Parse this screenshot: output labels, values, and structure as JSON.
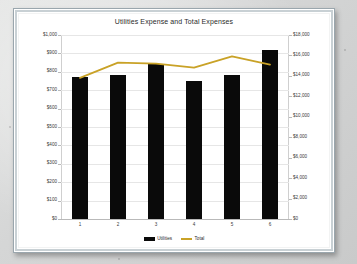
{
  "window": {
    "frame_style": "beveled-grey-border",
    "page_background": "#d9dada",
    "plot_background": "#ffffff"
  },
  "chart_data": {
    "type": "bar",
    "title": "Utilities Expense and Total Expenses",
    "xlabel": "",
    "ylabel": "",
    "categories": [
      "1",
      "2",
      "3",
      "4",
      "5",
      "6"
    ],
    "grid": true,
    "legend_position": "bottom",
    "series": [
      {
        "name": "Utilities",
        "type": "bar",
        "axis": "left",
        "color": "#0a0a0a",
        "values": [
          770,
          780,
          840,
          750,
          780,
          920
        ]
      },
      {
        "name": "Total",
        "type": "line",
        "axis": "right",
        "color": "#c9a227",
        "values": [
          13800,
          15300,
          15200,
          14800,
          15900,
          15100
        ]
      }
    ],
    "left_axis": {
      "label": "",
      "min": 0,
      "max": 1000,
      "step": 100,
      "ticks": [
        "$1,000",
        "$900",
        "$800",
        "$700",
        "$600",
        "$500",
        "$400",
        "$300",
        "$200",
        "$100",
        "$0"
      ]
    },
    "right_axis": {
      "label": "",
      "min": 0,
      "max": 18000,
      "step": 2000,
      "ticks": [
        "$18,000",
        "$16,000",
        "$14,000",
        "$12,000",
        "$10,000",
        "$8,000",
        "$6,000",
        "$4,000",
        "$2,000",
        "$0"
      ]
    },
    "legend": [
      {
        "label": "Utilities",
        "marker": "bar-swatch",
        "color": "#0a0a0a"
      },
      {
        "label": "Total",
        "marker": "line-swatch",
        "color": "#c9a227"
      }
    ]
  }
}
